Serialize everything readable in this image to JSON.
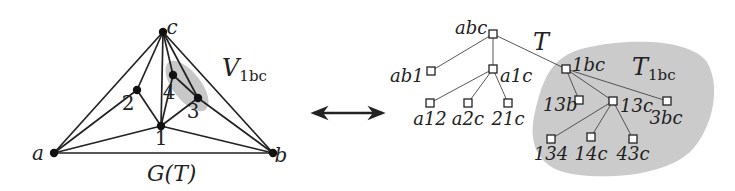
{
  "graph": {
    "title": "G(T)",
    "region_label": "V",
    "region_label_sub": "1bc",
    "vertices": [
      {
        "id": "a",
        "label": "a",
        "x": 54,
        "y": 153,
        "lx": 38,
        "ly": 160
      },
      {
        "id": "b",
        "label": "b",
        "x": 273,
        "y": 153,
        "lx": 281,
        "ly": 162
      },
      {
        "id": "c",
        "label": "c",
        "x": 163,
        "y": 32,
        "lx": 172,
        "ly": 34
      },
      {
        "id": "1",
        "label": "1",
        "x": 161,
        "y": 126,
        "lx": 161,
        "ly": 145
      },
      {
        "id": "2",
        "label": "2",
        "x": 137,
        "y": 90,
        "lx": 128,
        "ly": 110
      },
      {
        "id": "3",
        "label": "3",
        "x": 198,
        "y": 98,
        "lx": 193,
        "ly": 118
      },
      {
        "id": "4",
        "label": "4",
        "x": 173,
        "y": 75,
        "lx": 169,
        "ly": 99
      }
    ],
    "edges": [
      [
        "a",
        "b"
      ],
      [
        "a",
        "c"
      ],
      [
        "a",
        "2"
      ],
      [
        "a",
        "1"
      ],
      [
        "c",
        "2"
      ],
      [
        "c",
        "1"
      ],
      [
        "c",
        "4"
      ],
      [
        "c",
        "3"
      ],
      [
        "c",
        "b"
      ],
      [
        "2",
        "1"
      ],
      [
        "4",
        "3"
      ],
      [
        "4",
        "1"
      ],
      [
        "3",
        "1"
      ],
      [
        "3",
        "b"
      ],
      [
        "1",
        "b"
      ]
    ]
  },
  "arrow": {
    "x1": 308,
    "x2": 388,
    "y": 113,
    "type": "double-headed"
  },
  "tree": {
    "title": "T",
    "subtree_label": "T",
    "subtree_label_sub": "1bc",
    "nodes": [
      {
        "id": "abc",
        "label": "abc",
        "x": 493,
        "y": 34,
        "lx": 455,
        "ly": 34,
        "anchor": "start"
      },
      {
        "id": "ab1",
        "label": "ab1",
        "x": 431,
        "y": 71,
        "lx": 390,
        "ly": 82,
        "anchor": "start"
      },
      {
        "id": "a1c",
        "label": "a1c",
        "x": 493,
        "y": 69,
        "lx": 500,
        "ly": 82,
        "anchor": "start"
      },
      {
        "id": "1bc",
        "label": "1bc",
        "x": 566,
        "y": 69,
        "lx": 572,
        "ly": 71,
        "anchor": "start"
      },
      {
        "id": "a12",
        "label": "a12",
        "x": 430,
        "y": 103,
        "lx": 430,
        "ly": 125,
        "anchor": "middle"
      },
      {
        "id": "a2c",
        "label": "a2c",
        "x": 468,
        "y": 103,
        "lx": 468,
        "ly": 125,
        "anchor": "middle"
      },
      {
        "id": "21c",
        "label": "21c",
        "x": 508,
        "y": 103,
        "lx": 508,
        "ly": 125,
        "anchor": "middle"
      },
      {
        "id": "13b",
        "label": "13b",
        "x": 579,
        "y": 100,
        "lx": 543,
        "ly": 111,
        "anchor": "start"
      },
      {
        "id": "13c",
        "label": "13c",
        "x": 613,
        "y": 101,
        "lx": 620,
        "ly": 112,
        "anchor": "start"
      },
      {
        "id": "3bc",
        "label": "3bc",
        "x": 667,
        "y": 101,
        "lx": 666,
        "ly": 124,
        "anchor": "middle"
      },
      {
        "id": "134",
        "label": "134",
        "x": 551,
        "y": 139,
        "lx": 551,
        "ly": 160,
        "anchor": "middle"
      },
      {
        "id": "14c",
        "label": "14c",
        "x": 591,
        "y": 137,
        "lx": 591,
        "ly": 160,
        "anchor": "middle"
      },
      {
        "id": "43c",
        "label": "43c",
        "x": 633,
        "y": 139,
        "lx": 633,
        "ly": 160,
        "anchor": "middle"
      }
    ],
    "edges": [
      [
        "abc",
        "ab1"
      ],
      [
        "abc",
        "a1c"
      ],
      [
        "abc",
        "1bc"
      ],
      [
        "a1c",
        "a12"
      ],
      [
        "a1c",
        "a2c"
      ],
      [
        "a1c",
        "21c"
      ],
      [
        "1bc",
        "13b"
      ],
      [
        "1bc",
        "13c"
      ],
      [
        "1bc",
        "3bc"
      ],
      [
        "13c",
        "134"
      ],
      [
        "13c",
        "14c"
      ],
      [
        "13c",
        "43c"
      ]
    ]
  },
  "colors": {
    "shade": "#c8c8c8",
    "ink": "#222222"
  }
}
